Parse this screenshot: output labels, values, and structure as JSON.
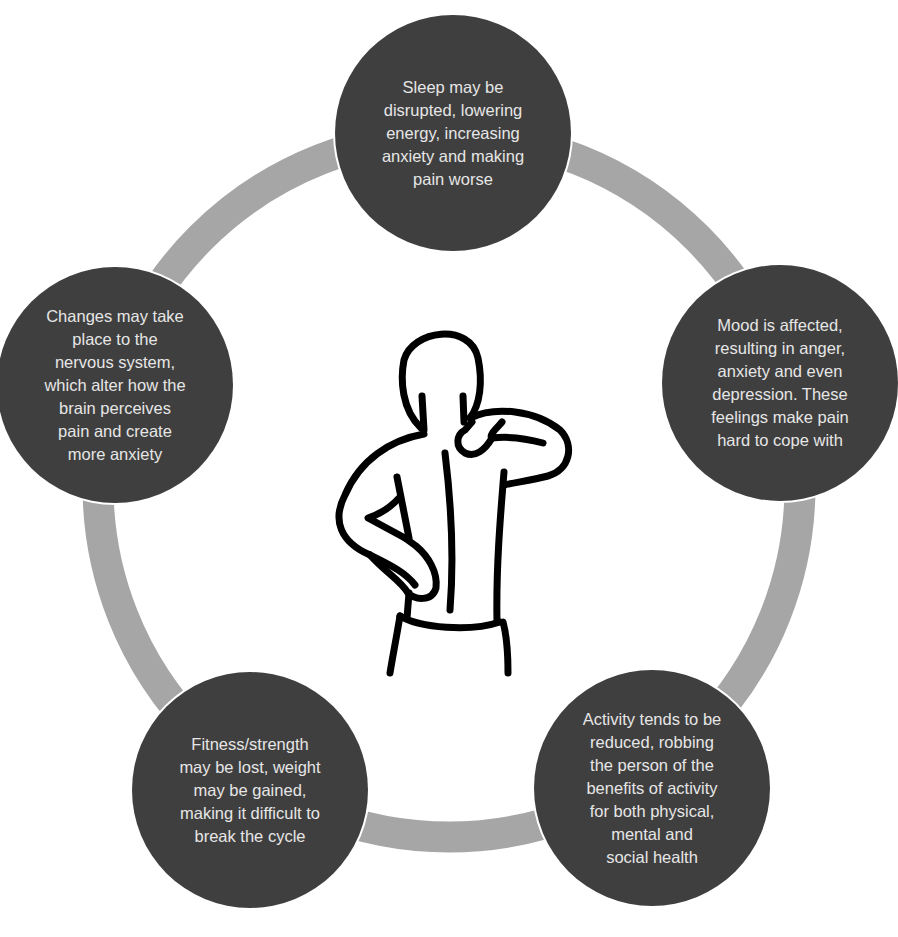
{
  "diagram": {
    "type": "cycle",
    "ring_color": "#a6a6a6",
    "node_color": "#3f3f3f",
    "text_color": "#e6e6e6",
    "center_icon": "person-back-pain-icon",
    "nodes": [
      {
        "id": "sleep",
        "position": "top",
        "text": "Sleep may be\ndisrupted, lowering\nenergy, increasing\nanxiety and making\npain worse"
      },
      {
        "id": "mood",
        "position": "right",
        "text": "Mood is affected,\nresulting in anger,\nanxiety and even\ndepression. These\nfeelings make pain\nhard to cope with"
      },
      {
        "id": "activity",
        "position": "bottom-right",
        "text": "Activity tends to be\nreduced, robbing\nthe person of the\nbenefits of activity\nfor both physical,\nmental and\nsocial health"
      },
      {
        "id": "fitness",
        "position": "bottom-left",
        "text": "Fitness/strength\nmay be lost, weight\nmay be gained,\nmaking it difficult to\nbreak the cycle"
      },
      {
        "id": "nervous-system",
        "position": "left",
        "text": "Changes may take\nplace to the\nnervous system,\nwhich alter how the\nbrain perceives\npain and create\nmore anxiety"
      }
    ]
  }
}
